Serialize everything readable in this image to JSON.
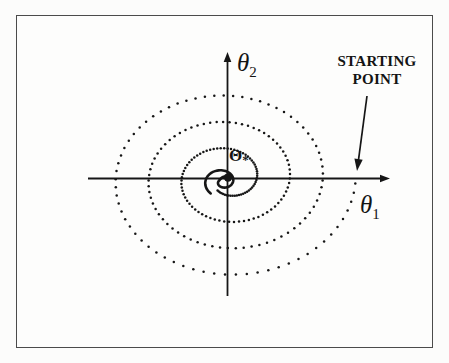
{
  "figure": {
    "background": "#fdfdfc",
    "border_color": "#4b4b4b",
    "ink_color": "#161616"
  },
  "labels": {
    "y_axis": {
      "symbol": "θ",
      "subscript": "2"
    },
    "x_axis": {
      "symbol": "θ",
      "subscript": "1"
    },
    "optimum": {
      "symbol": "Θ",
      "star": "*"
    },
    "annotation": {
      "line1": "STARTING",
      "line2": "POINT"
    }
  },
  "chart_data": {
    "type": "scatter",
    "title": "",
    "xlabel": "θ1",
    "ylabel": "θ2",
    "grid": false,
    "legend": "none",
    "axes": {
      "origin_px": {
        "x": 227.5,
        "y": 178.5
      },
      "x_axis": {
        "from_px": 88,
        "to_px": 381,
        "tip_px": 390,
        "y_px": 178.5
      },
      "y_axis": {
        "from_px": 296,
        "to_px": 61,
        "tip_px": 52,
        "x_px": 227.5
      }
    },
    "starting_point_px": {
      "x": 356,
      "y": 184
    },
    "optimum_px": {
      "x": 228,
      "y": 177.5,
      "dot_radius": 4.2
    },
    "x_axis_right_crossings_px": [
      357,
      322,
      290,
      257
    ],
    "x_axis_left_crossings_px": [
      110,
      143,
      175
    ],
    "y_axis_top_crossings_px": [
      95,
      123,
      150
    ],
    "y_axis_bottom_crossings_px": [
      280,
      252,
      227,
      203
    ],
    "spiral": {
      "direction": "clockwise",
      "center": {
        "x": 227.5,
        "y": 178.5
      },
      "aspect_ratio": 1.25,
      "start_angle_rad": -0.05,
      "start_radius_px": 128,
      "radius_shrink_px_per_rad": 5.25,
      "angle_step_rad": 0.0907,
      "dotted_min_radius_px": 18,
      "dot_radius_px": 1.25,
      "solid": {
        "center": {
          "x": 222.5,
          "y": 181.5
        },
        "start_radius_px": 19,
        "end_radius_px": 4,
        "turns": 1.15,
        "stroke_width": 2.6
      }
    },
    "annotation_arrow": {
      "from": {
        "x": 367,
        "y": 96
      },
      "to": {
        "x": 357,
        "y": 171
      }
    }
  }
}
